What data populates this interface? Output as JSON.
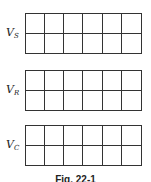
{
  "figure": {
    "panels": [
      {
        "label_main": "V",
        "label_sub": "S",
        "rows": 2,
        "cols": 6
      },
      {
        "label_main": "V",
        "label_sub": "R",
        "rows": 2,
        "cols": 6
      },
      {
        "label_main": "V",
        "label_sub": "C",
        "rows": 2,
        "cols": 6
      }
    ],
    "caption": "Fig. 22-1"
  }
}
